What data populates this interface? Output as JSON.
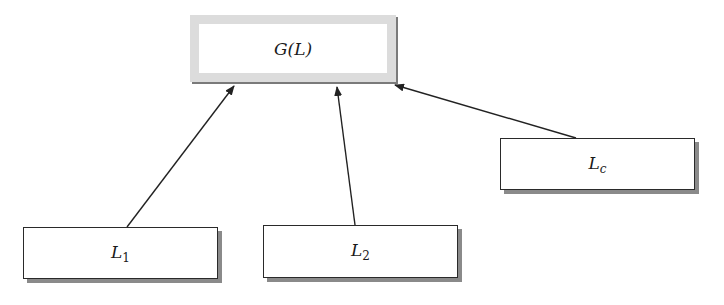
{
  "diagram": {
    "type": "hierarchy",
    "nodes": [
      {
        "id": "G",
        "label_main": "G(L)",
        "label_sub": "",
        "role": "root"
      },
      {
        "id": "L1",
        "label_main": "L",
        "label_sub": "1",
        "role": "child"
      },
      {
        "id": "L2",
        "label_main": "L",
        "label_sub": "2",
        "role": "child"
      },
      {
        "id": "Lc",
        "label_main": "L",
        "label_sub": "c",
        "role": "child"
      }
    ],
    "edges": [
      {
        "from": "L1",
        "to": "G"
      },
      {
        "from": "L2",
        "to": "G"
      },
      {
        "from": "Lc",
        "to": "G"
      }
    ],
    "colors": {
      "root_border": "#dcdcdc",
      "box_border": "#2a2a2a",
      "shadow": "#8a8a8a",
      "arrow": "#222222",
      "background": "#ffffff"
    }
  }
}
